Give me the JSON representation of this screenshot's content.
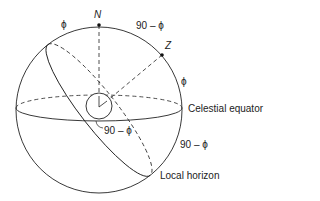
{
  "diagram": {
    "labels": {
      "north_pole": "N",
      "zenith": "Z",
      "phi_top_left": "ϕ",
      "ninety_minus_phi_top": "90 – ϕ",
      "phi_right": "ϕ",
      "ninety_minus_phi_center": "90 – ϕ",
      "ninety_minus_phi_right": "90 – ϕ",
      "celestial_equator": "Celestial equator",
      "local_horizon": "Local horizon"
    },
    "colors": {
      "stroke": "#222222",
      "background": "#ffffff"
    }
  }
}
